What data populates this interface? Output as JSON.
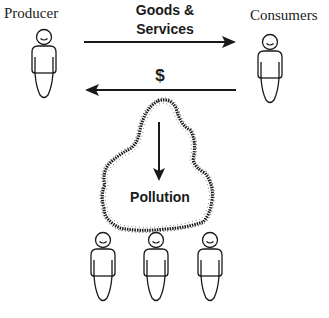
{
  "diagram": {
    "actors": {
      "producer": {
        "label": "Producer"
      },
      "consumers": {
        "label": "Consumers"
      },
      "third_parties": {
        "count": 3
      }
    },
    "flows": {
      "goods_services": {
        "line1": "Goods &",
        "line2": "Services",
        "from": "producer",
        "to": "consumers"
      },
      "money": {
        "label": "$",
        "from": "consumers",
        "to": "producer"
      },
      "pollution": {
        "label": "Pollution",
        "to": "third_parties"
      }
    },
    "colors": {
      "ink": "#1a1a1a",
      "background": "#ffffff"
    }
  }
}
